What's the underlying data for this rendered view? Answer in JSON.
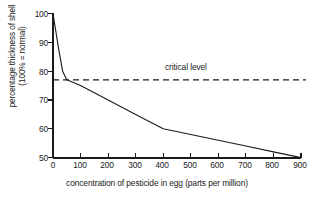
{
  "chart_data": {
    "type": "line",
    "title": "",
    "xlabel": "concentration of pesticide in egg (parts per million)",
    "ylabel_line1": "percentage thickness of shell",
    "ylabel_line2": "(100% = normal)",
    "xlim": [
      0,
      900
    ],
    "ylim": [
      50,
      100
    ],
    "xticks": [
      0,
      100,
      200,
      300,
      400,
      500,
      600,
      700,
      800,
      900
    ],
    "yticks": [
      50,
      60,
      70,
      80,
      90,
      100
    ],
    "xtick_labels": [
      "0",
      "100",
      "200",
      "300",
      "400",
      "500",
      "600",
      "700",
      "800",
      "900"
    ],
    "ytick_labels": [
      "50",
      "60",
      "70",
      "80",
      "90",
      "100"
    ],
    "grid": false,
    "legend": "none",
    "series": [
      {
        "name": "shell thickness",
        "style": "solid",
        "color": "#1a1a1a",
        "x": [
          0,
          20,
          35,
          50,
          100,
          200,
          300,
          400,
          500,
          600,
          700,
          800,
          900
        ],
        "y": [
          100,
          88,
          80,
          77,
          75,
          70,
          65,
          60,
          58,
          56,
          54,
          52,
          50
        ]
      }
    ],
    "annotations": [
      {
        "type": "hline",
        "label": "critical level",
        "y_value": 77,
        "style": "dashed",
        "color": "#1a1a1a",
        "label_x": 380
      }
    ]
  }
}
